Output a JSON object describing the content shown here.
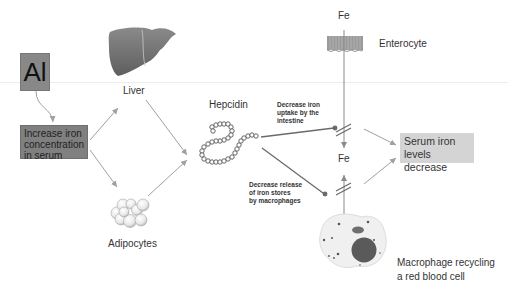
{
  "diagram": {
    "nodes": {
      "al": {
        "label": "Al"
      },
      "increase_iron": {
        "label_lines": [
          "Increase iron",
          "concentration",
          "in serum"
        ]
      },
      "liver": {
        "label": "Liver"
      },
      "adipocytes": {
        "label": "Adipocytes"
      },
      "hepcidin": {
        "label": "Hepcidin"
      },
      "fe_top": {
        "label": "Fe"
      },
      "enterocyte": {
        "label": "Enterocyte"
      },
      "fe_middle": {
        "label": "Fe"
      },
      "serum": {
        "label_lines": [
          "Serum iron",
          "levels decrease"
        ]
      },
      "macrophage": {
        "label_lines": [
          "Macrophage recycling",
          "a red blood cell"
        ]
      }
    },
    "annotations": {
      "uptake": {
        "lines": [
          "Decrease iron",
          "uptake by the",
          "intestine"
        ]
      },
      "release": {
        "lines": [
          "Decrease release",
          "of iron stores",
          "by macrophages"
        ]
      }
    },
    "colors": {
      "al_box": "#888888",
      "iron_box": "#808080",
      "serum_box": "#d4d4d4",
      "arrow": "#a0a0a0",
      "inhibit_line": "#6a6a6a",
      "liver": "#7a7a7a",
      "nucleus": "#5a5a5a"
    }
  }
}
